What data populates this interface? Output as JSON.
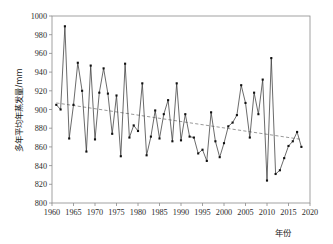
{
  "chart_data": {
    "type": "line",
    "title": "",
    "subtitle": "",
    "xlabel": "年份",
    "ylabel": "多年平均年蒸发量/mm",
    "xlim": [
      1960,
      2020
    ],
    "ylim": [
      800,
      1000
    ],
    "xticks": [
      1960,
      1965,
      1970,
      1975,
      1980,
      1985,
      1990,
      1995,
      2000,
      2005,
      2010,
      2015,
      2020
    ],
    "yticks": [
      800,
      820,
      840,
      860,
      880,
      900,
      920,
      940,
      960,
      980,
      1000
    ],
    "xtick_labels": [
      "1960",
      "1965",
      "1970",
      "1975",
      "1980",
      "1985",
      "1990",
      "1995",
      "2000",
      "2005",
      "2010",
      "2015",
      "2020"
    ],
    "ytick_labels": [
      "800",
      "820",
      "840",
      "860",
      "880",
      "900",
      "920",
      "940",
      "960",
      "980",
      "1000"
    ],
    "grid": false,
    "legend": null,
    "legend_position": "none",
    "marker": "square",
    "series": [
      {
        "name": "多年平均年蒸发量",
        "style": "line-with-markers",
        "color": "#111111",
        "x": [
          1961,
          1962,
          1963,
          1964,
          1965,
          1966,
          1967,
          1968,
          1969,
          1970,
          1971,
          1972,
          1973,
          1974,
          1975,
          1976,
          1977,
          1978,
          1979,
          1980,
          1981,
          1982,
          1983,
          1984,
          1985,
          1986,
          1987,
          1988,
          1989,
          1990,
          1991,
          1992,
          1993,
          1994,
          1995,
          1996,
          1997,
          1998,
          1999,
          2000,
          2001,
          2002,
          2003,
          2004,
          2005,
          2006,
          2007,
          2008,
          2009,
          2010,
          2011,
          2012,
          2013,
          2014,
          2015,
          2016,
          2017,
          2018
        ],
        "values": [
          905,
          900,
          989,
          869,
          905,
          950,
          920,
          855,
          947,
          868,
          918,
          944,
          917,
          874,
          915,
          850,
          949,
          870,
          883,
          877,
          928,
          851,
          871,
          899,
          869,
          895,
          910,
          866,
          928,
          867,
          895,
          871,
          870,
          853,
          857,
          845,
          897,
          866,
          849,
          864,
          882,
          886,
          894,
          926,
          907,
          870,
          918,
          895,
          932,
          824,
          955,
          831,
          835,
          848,
          861,
          866,
          876,
          860
        ]
      },
      {
        "name": "线性趋势线",
        "style": "dashed-trend",
        "color": "#777777",
        "x": [
          1961,
          2018
        ],
        "values": [
          907,
          868
        ]
      }
    ],
    "annotations": []
  }
}
